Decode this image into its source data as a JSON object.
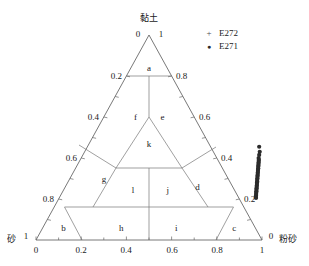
{
  "figure": {
    "type": "ternary-soil-texture-triangle",
    "apex_label": "黏土",
    "left_label": "砂",
    "right_label": "粉砂",
    "corner_value_apex_left": "0",
    "corner_value_apex_right": "1",
    "corner_value_left": "1",
    "corner_value_left_bottom": "0",
    "corner_value_right": "0",
    "corner_value_right_bottom": "1"
  },
  "axes": {
    "bottom": {
      "name": "bottom-axis",
      "ticks": [
        "0",
        "0.2",
        "0.4",
        "0.6",
        "0.8",
        "1"
      ],
      "values": [
        0,
        0.2,
        0.4,
        0.6,
        0.8,
        1.0
      ]
    },
    "left": {
      "name": "left-axis",
      "ticks": [
        "0.2",
        "0.4",
        "0.6",
        "0.8"
      ],
      "values": [
        0.2,
        0.4,
        0.6,
        0.8
      ]
    },
    "right": {
      "name": "right-axis",
      "ticks": [
        "0.8",
        "0.6",
        "0.4",
        "0.2"
      ],
      "values": [
        0.8,
        0.6,
        0.4,
        0.2
      ]
    }
  },
  "regions": [
    {
      "id": "a",
      "label": "a",
      "x": 0.5,
      "y": 0.84
    },
    {
      "id": "f",
      "label": "f",
      "x": 0.352,
      "y": 0.6
    },
    {
      "id": "e",
      "label": "e",
      "x": 0.648,
      "y": 0.6
    },
    {
      "id": "k",
      "label": "k",
      "x": 0.5,
      "y": 0.47
    },
    {
      "id": "g",
      "label": "g",
      "x": 0.216,
      "y": 0.3
    },
    {
      "id": "l",
      "label": "l",
      "x": 0.406,
      "y": 0.245
    },
    {
      "id": "j",
      "label": "j",
      "x": 0.61,
      "y": 0.245
    },
    {
      "id": "d",
      "label": "d",
      "x": 0.79,
      "y": 0.26
    },
    {
      "id": "b",
      "label": "b",
      "x": 0.098,
      "y": 0.058
    },
    {
      "id": "h",
      "label": "h",
      "x": 0.37,
      "y": 0.058
    },
    {
      "id": "i",
      "label": "i",
      "x": 0.628,
      "y": 0.058
    },
    {
      "id": "c",
      "label": "c",
      "x": 0.9,
      "y": 0.058
    }
  ],
  "legend": {
    "name": "series-legend",
    "items": [
      {
        "marker": "plus-marker",
        "glyph": "+",
        "label": "E272",
        "color": "#4d4d4d"
      },
      {
        "marker": "dot-marker",
        "glyph": "●",
        "label": "E271",
        "color": "#2b2b2b"
      }
    ]
  },
  "chart_data": {
    "type": "scatter",
    "title": "",
    "xlabel": "粉砂",
    "ylabel": "黏土",
    "zlabel": "砂",
    "grid": false,
    "legend_position": "top-right",
    "axis_ranges": {
      "clay": [
        0,
        1
      ],
      "silt": [
        0,
        1
      ],
      "sand": [
        0,
        1
      ]
    },
    "series": [
      {
        "name": "E272",
        "marker": "+",
        "color": "#4d4d4d",
        "points": []
      },
      {
        "name": "E271",
        "marker": "●",
        "color": "#2b2b2b",
        "note": "dense elongated cluster hugging the clay-silt (right) edge between roughly 0.20 and 0.45 clay",
        "points": [
          {
            "silt": 0.76,
            "clay": 0.455,
            "sand": -0.215
          },
          {
            "silt": 0.775,
            "clay": 0.43,
            "sand": -0.205
          },
          {
            "silt": 0.78,
            "clay": 0.415,
            "sand": -0.195
          },
          {
            "silt": 0.785,
            "clay": 0.4,
            "sand": -0.185
          },
          {
            "silt": 0.79,
            "clay": 0.392,
            "sand": -0.182
          },
          {
            "silt": 0.793,
            "clay": 0.385,
            "sand": -0.178
          },
          {
            "silt": 0.796,
            "clay": 0.378,
            "sand": -0.174
          },
          {
            "silt": 0.799,
            "clay": 0.371,
            "sand": -0.17
          },
          {
            "silt": 0.802,
            "clay": 0.364,
            "sand": -0.166
          },
          {
            "silt": 0.805,
            "clay": 0.357,
            "sand": -0.162
          },
          {
            "silt": 0.808,
            "clay": 0.35,
            "sand": -0.158
          },
          {
            "silt": 0.811,
            "clay": 0.343,
            "sand": -0.154
          },
          {
            "silt": 0.814,
            "clay": 0.336,
            "sand": -0.15
          },
          {
            "silt": 0.817,
            "clay": 0.329,
            "sand": -0.146
          },
          {
            "silt": 0.82,
            "clay": 0.322,
            "sand": -0.142
          },
          {
            "silt": 0.823,
            "clay": 0.315,
            "sand": -0.138
          },
          {
            "silt": 0.826,
            "clay": 0.308,
            "sand": -0.134
          },
          {
            "silt": 0.829,
            "clay": 0.301,
            "sand": -0.13
          },
          {
            "silt": 0.832,
            "clay": 0.294,
            "sand": -0.126
          },
          {
            "silt": 0.835,
            "clay": 0.287,
            "sand": -0.122
          },
          {
            "silt": 0.838,
            "clay": 0.28,
            "sand": -0.118
          },
          {
            "silt": 0.841,
            "clay": 0.273,
            "sand": -0.114
          },
          {
            "silt": 0.844,
            "clay": 0.266,
            "sand": -0.11
          },
          {
            "silt": 0.847,
            "clay": 0.259,
            "sand": -0.106
          },
          {
            "silt": 0.85,
            "clay": 0.252,
            "sand": -0.102
          },
          {
            "silt": 0.853,
            "clay": 0.245,
            "sand": -0.098
          },
          {
            "silt": 0.856,
            "clay": 0.238,
            "sand": -0.094
          },
          {
            "silt": 0.859,
            "clay": 0.231,
            "sand": -0.09
          },
          {
            "silt": 0.862,
            "clay": 0.224,
            "sand": -0.086
          },
          {
            "silt": 0.865,
            "clay": 0.217,
            "sand": -0.082
          },
          {
            "silt": 0.868,
            "clay": 0.21,
            "sand": -0.078
          },
          {
            "silt": 0.871,
            "clay": 0.205,
            "sand": -0.076
          }
        ]
      }
    ]
  },
  "caption": ""
}
